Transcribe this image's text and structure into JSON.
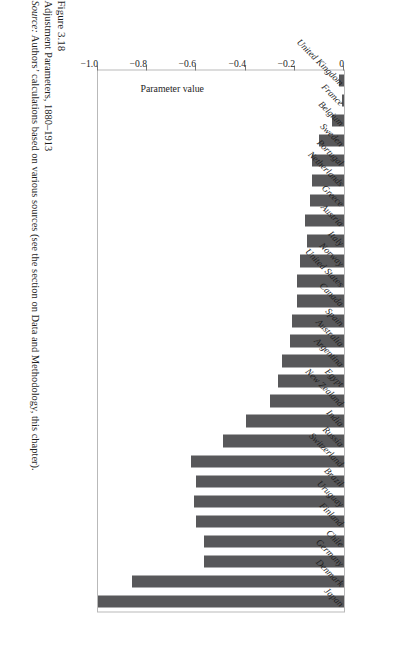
{
  "figure": {
    "number_line": "Figure 3.18",
    "title_line": "Adjustment Parameters, 1880–1913",
    "source_label": "Source:",
    "source_text": " Authors’ calculations based on various sources (see the section on Data and Methodology, this chapter)."
  },
  "colors": {
    "bar": "#58585a",
    "frame": "#b9b9b9",
    "text": "#1e1e1e",
    "page_background": "#ffffff"
  },
  "chart_data": {
    "type": "bar",
    "orientation": "horizontal",
    "title": "Adjustment Parameters, 1880–1913",
    "xlabel": "",
    "ylabel": "Parameter value",
    "ylim": [
      0,
      -1.0
    ],
    "grid": false,
    "legend": false,
    "tick_labels": [
      "0",
      "−0.2",
      "−0.4",
      "−0.6",
      "−0.8",
      "−1.0"
    ],
    "tick_values": [
      0,
      -0.2,
      -0.4,
      -0.6,
      -0.8,
      -1.0
    ],
    "categories": [
      "United Kingdom",
      "France",
      "Belgium",
      "Sweden",
      "Portugal",
      "Netherlands",
      "Greece",
      "Austria",
      "Italy",
      "Norway",
      "United States",
      "Canada",
      "Spain",
      "Australia",
      "Argentina",
      "Egypt",
      "New Zealand",
      "India",
      "Russia",
      "Switzerland",
      "Brazil",
      "Uruguay",
      "Finland",
      "Chile",
      "Germany",
      "Denmark",
      "Japan"
    ],
    "values": [
      -0.02,
      -0.01,
      -0.05,
      -0.1,
      -0.13,
      -0.13,
      -0.14,
      -0.16,
      -0.15,
      -0.18,
      -0.19,
      -0.19,
      -0.21,
      -0.22,
      -0.25,
      -0.27,
      -0.3,
      -0.4,
      -0.49,
      -0.62,
      -0.6,
      -0.61,
      -0.6,
      -0.57,
      -0.57,
      -0.86,
      -1.0
    ]
  }
}
